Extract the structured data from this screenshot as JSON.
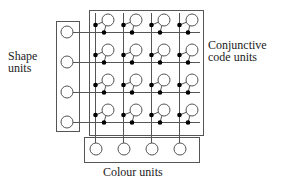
{
  "labels": {
    "shape": [
      "Shape",
      "units"
    ],
    "conjunctive": [
      "Conjunctive",
      "code units"
    ],
    "colour": "Colour units"
  },
  "colors": {
    "stroke": "#555555",
    "fill": "#ffffff",
    "dot": "#000000",
    "text": "#222222"
  },
  "grid": {
    "rows": 4,
    "cols": 4
  },
  "geometry": {
    "row_y": [
      32,
      62,
      92,
      122
    ],
    "col_x": [
      95,
      123,
      151,
      179
    ],
    "shape_box": {
      "x": 56,
      "y": 21,
      "w": 23,
      "h": 110
    },
    "shape_circle_x": 67,
    "conj_box": {
      "x": 89,
      "y": 10,
      "w": 114,
      "h": 125
    },
    "colour_box": {
      "x": 84,
      "y": 137,
      "w": 115,
      "h": 25
    },
    "colour_circle_y": 149,
    "unit_radius": 6
  }
}
